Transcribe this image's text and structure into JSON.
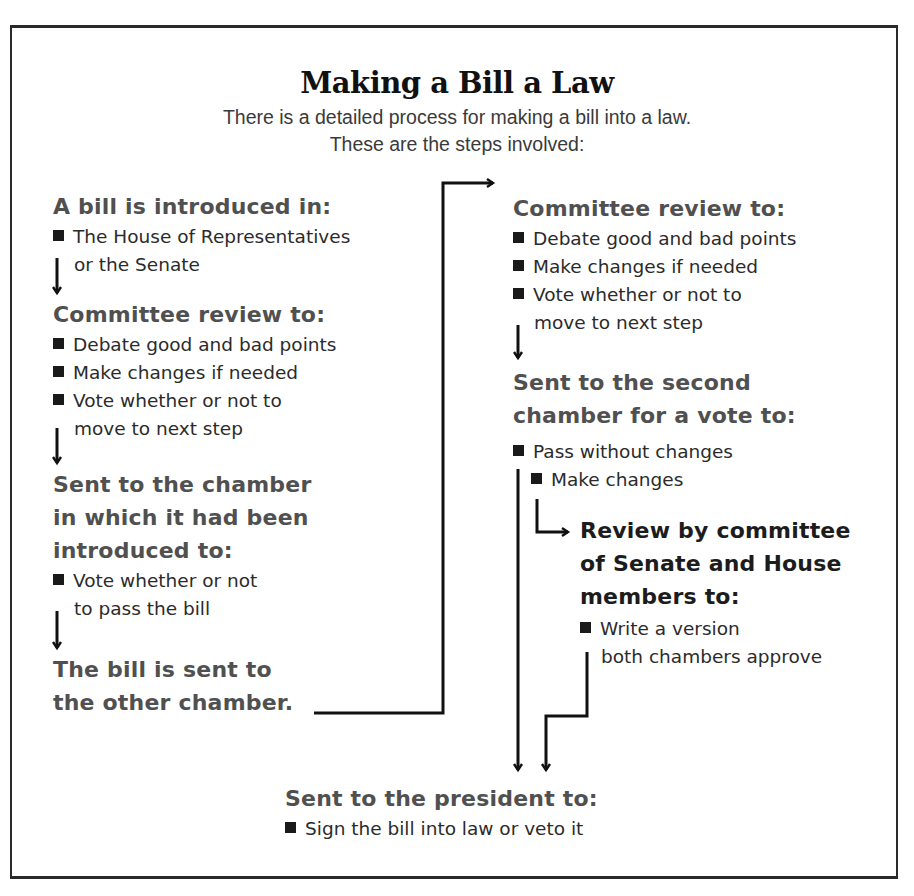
{
  "title": "Making a Bill a Law",
  "subtitle": {
    "line1": "There is a detailed process for making a bill into a law.",
    "line2": "These are the steps involved:"
  },
  "left_column": {
    "step1": {
      "heading": "A bill is introduced in:",
      "items": [
        "The House of Representatives",
        "or the Senate"
      ]
    },
    "step2": {
      "heading": "Committee review to:",
      "items": [
        "Debate good and bad points",
        "Make changes if needed",
        "Vote whether or not to",
        "move to next step"
      ]
    },
    "step3": {
      "heading_lines": [
        "Sent to the chamber",
        "in which it had been",
        "introduced to:"
      ],
      "items": [
        "Vote whether or not",
        "to pass the bill"
      ]
    },
    "step4": {
      "heading_lines": [
        "The bill is sent to",
        "the other chamber."
      ]
    }
  },
  "right_column": {
    "step5": {
      "heading": "Committee review to:",
      "items": [
        "Debate good and bad points",
        "Make changes if needed",
        "Vote whether or not to",
        "move to next step"
      ]
    },
    "step6": {
      "heading_lines": [
        "Sent to the second",
        "chamber for a vote to:"
      ],
      "items": [
        "Pass without changes",
        "Make changes"
      ]
    },
    "step7": {
      "heading_lines": [
        "Review by committee",
        "of Senate and House",
        "members to:"
      ],
      "items": [
        "Write a version",
        "both chambers approve"
      ]
    }
  },
  "final_step": {
    "heading": "Sent to the president to:",
    "items": [
      "Sign the bill into law or veto it"
    ]
  },
  "icons": {
    "bullet": "black-square",
    "flow": "arrow"
  },
  "colors": {
    "heading_gray": "#505050",
    "heading_dark": "#1c1c1c",
    "text": "#2b2b2b",
    "border": "#2a2a2a"
  }
}
